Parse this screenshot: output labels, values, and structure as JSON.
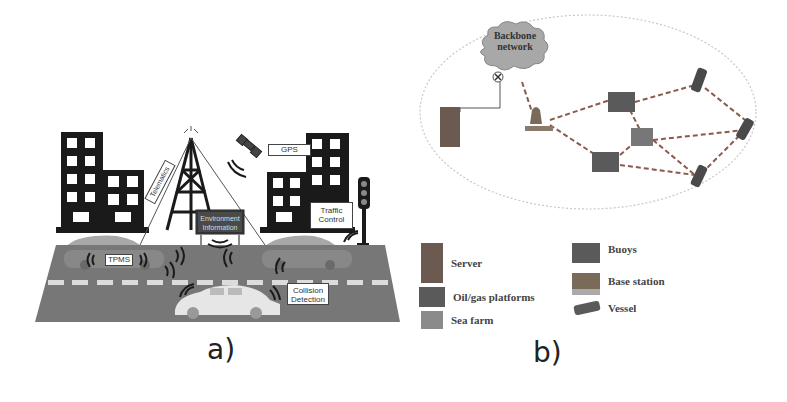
{
  "panel_a": {
    "label": "a)",
    "tags": {
      "telematics": "Telematics",
      "gps": "GPS",
      "environment_line1": "Environment",
      "environment_line2": "Information",
      "traffic_line1": "Traffic",
      "traffic_line2": "Control",
      "tpms": "TPMS",
      "collision_line1": "Collision",
      "collision_line2": "Detection"
    },
    "colors": {
      "road": "#777777",
      "building": "#1a1a1a",
      "car": "#a8a8a8",
      "car_front": "#e6e6e6"
    }
  },
  "panel_b": {
    "label": "b)",
    "cloud_line1": "Backbone",
    "cloud_line2": "network",
    "legend": [
      {
        "icon": "server-icon",
        "label": "Server"
      },
      {
        "icon": "oil-gas-platform-icon",
        "label": "Oil/gas platforms"
      },
      {
        "icon": "sea-farm-icon",
        "label": "Sea farm"
      },
      {
        "icon": "buoy-icon",
        "label": "Buoys"
      },
      {
        "icon": "base-station-icon",
        "label": "Base station"
      },
      {
        "icon": "vessel-icon",
        "label": "Vessel"
      }
    ],
    "colors": {
      "link": "#8a5a4a",
      "ellipse": "#c8c8c8",
      "cloud": "#a0a0a0"
    }
  }
}
